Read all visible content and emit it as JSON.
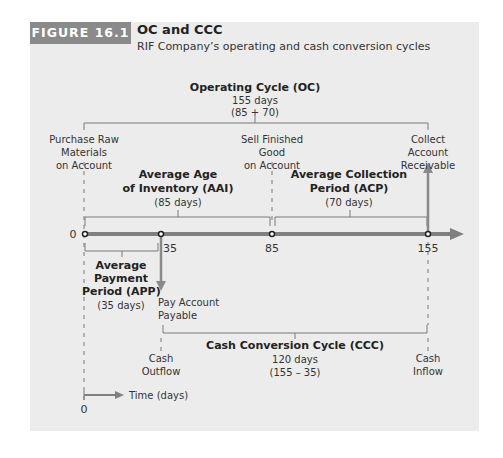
{
  "figure": {
    "label": "FIGURE 16.1",
    "title": "OC and CCC",
    "subtitle": "RIF Company’s operating and cash conversion cycles"
  },
  "operating_cycle": {
    "title": "Operating Cycle (OC)",
    "days": "155 days",
    "formula": "(85 + 70)"
  },
  "events": {
    "purchase": [
      "Purchase Raw",
      "Materials",
      "on Account"
    ],
    "sell": [
      "Sell Finished",
      "Good",
      "on Account"
    ],
    "collect": [
      "Collect",
      "Account",
      "Receivable"
    ],
    "pay": [
      "Pay Account",
      "Payable"
    ]
  },
  "aai": {
    "title_line1": "Average Age",
    "title_line2": "of Inventory (AAI)",
    "days": "(85 days)"
  },
  "acp": {
    "title_line1": "Average Collection",
    "title_line2": "Period (ACP)",
    "days": "(70 days)"
  },
  "app": {
    "title_line1": "Average",
    "title_line2": "Payment",
    "title_line3": "Period (APP)",
    "days": "(35 days)"
  },
  "timeline": {
    "ticks": [
      {
        "label": "0",
        "value": 0
      },
      {
        "label": "35",
        "value": 35
      },
      {
        "label": "85",
        "value": 85
      },
      {
        "label": "155",
        "value": 155
      }
    ]
  },
  "ccc": {
    "title": "Cash Conversion Cycle (CCC)",
    "days": "120 days",
    "formula": "(155 – 35)"
  },
  "cash": {
    "outflow": [
      "Cash",
      "Outflow"
    ],
    "inflow": [
      "Cash",
      "Inflow"
    ]
  },
  "legend": {
    "label": "Time (days)",
    "zero": "0"
  },
  "colors": {
    "panel": "#ececec",
    "label_bg": "#8a8a8a",
    "timeline": "#808080",
    "bracket": "#7a7a7a"
  }
}
